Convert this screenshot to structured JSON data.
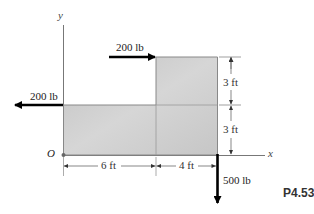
{
  "problem_label": "P4.53",
  "axes": {
    "x_label": "x",
    "y_label": "y",
    "origin_label": "O"
  },
  "forces": [
    {
      "id": "top",
      "label": "200 lb",
      "direction": "right"
    },
    {
      "id": "left",
      "label": "200 lb",
      "direction": "left"
    },
    {
      "id": "bottom",
      "label": "500 lb",
      "direction": "down"
    }
  ],
  "dimensions": {
    "horizontal": [
      {
        "label": "6 ft"
      },
      {
        "label": "4 ft"
      }
    ],
    "vertical": [
      {
        "label": "3 ft"
      },
      {
        "label": "3 ft"
      }
    ]
  },
  "colors": {
    "plate_light": "#dadada",
    "plate_dark": "#bdbdbd",
    "line": "#666666",
    "arrow": "#000000",
    "text": "#222222"
  }
}
